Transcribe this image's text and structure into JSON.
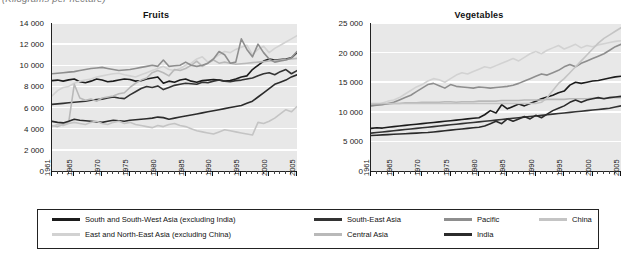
{
  "caption": "(Kilograms per hectare)",
  "legend": {
    "items": [
      {
        "label": "South and South-West Asia (excluding India)",
        "color": "#1c1c1c",
        "weight": "thick",
        "col": 0,
        "row": 0
      },
      {
        "label": "East and North-East Asia (excluding China)",
        "color": "#d2d2d2",
        "weight": "thin",
        "col": 0,
        "row": 1
      },
      {
        "label": "South-East Asia",
        "color": "#333333",
        "weight": "thick",
        "col": 1,
        "row": 0
      },
      {
        "label": "Central Asia",
        "color": "#b9b9b9",
        "weight": "thin",
        "col": 1,
        "row": 1
      },
      {
        "label": "Pacific",
        "color": "#8e8e8e",
        "weight": "thick",
        "col": 2,
        "row": 0
      },
      {
        "label": "India",
        "color": "#2b2b2b",
        "weight": "thick",
        "col": 2,
        "row": 1
      },
      {
        "label": "China",
        "color": "#c4c4c4",
        "weight": "thin",
        "col": 3,
        "row": 0
      }
    ]
  },
  "chart_data": [
    {
      "type": "line",
      "title": "Fruits",
      "xlabel": "",
      "ylabel": "",
      "unit": "Kilograms per hectare",
      "grid": true,
      "legend_position": "bottom",
      "xlim": [
        1961,
        2005
      ],
      "ylim": [
        0,
        14000
      ],
      "yticks": [
        0,
        2000,
        4000,
        6000,
        8000,
        10000,
        12000,
        14000
      ],
      "ytick_labels": [
        "0",
        "2 000",
        "4 000",
        "6 000",
        "8 000",
        "10 000",
        "12 000",
        "14 000"
      ],
      "xticks": [
        1961,
        1965,
        1970,
        1975,
        1980,
        1985,
        1990,
        1995,
        2000,
        2005
      ],
      "xtick_labels": [
        "1961",
        "1965",
        "1970",
        "1975",
        "1980",
        "1985",
        "1990",
        "1995",
        "2000",
        "2005"
      ],
      "x": [
        1961,
        1962,
        1963,
        1964,
        1965,
        1966,
        1967,
        1968,
        1969,
        1970,
        1971,
        1972,
        1973,
        1974,
        1975,
        1976,
        1977,
        1978,
        1979,
        1980,
        1981,
        1982,
        1983,
        1984,
        1985,
        1986,
        1987,
        1988,
        1989,
        1990,
        1991,
        1992,
        1993,
        1994,
        1995,
        1996,
        1997,
        1998,
        1999,
        2000,
        2001,
        2002,
        2003,
        2004,
        2005
      ],
      "series": [
        {
          "name": "South and South-West Asia (excluding India)",
          "color": "#1c1c1c",
          "values": [
            8550,
            8600,
            8500,
            8620,
            8700,
            8450,
            8350,
            8500,
            8700,
            8600,
            8450,
            8500,
            8600,
            8700,
            8650,
            8500,
            8550,
            8700,
            8800,
            8900,
            8300,
            8500,
            8400,
            8600,
            8700,
            8500,
            8400,
            8550,
            8600,
            8650,
            8600,
            8500,
            8550,
            8700,
            8900,
            9000,
            9600,
            10000,
            10400,
            10600,
            10500,
            10550,
            10600,
            10700,
            11200
          ]
        },
        {
          "name": "East and North-East Asia (excluding China)",
          "color": "#d2d2d2",
          "values": [
            7100,
            7600,
            7900,
            8000,
            8300,
            8500,
            8600,
            8700,
            8900,
            9000,
            9100,
            9200,
            9250,
            9100,
            9000,
            8900,
            9100,
            9300,
            9500,
            9700,
            9900,
            9600,
            9500,
            9700,
            10000,
            10200,
            10600,
            10800,
            10300,
            10600,
            11000,
            11300,
            11200,
            11500,
            11700,
            11900,
            11000,
            11500,
            11800,
            11200,
            11600,
            11900,
            12200,
            12500,
            12800
          ]
        },
        {
          "name": "South-East Asia",
          "color": "#333333",
          "values": [
            6300,
            6350,
            6400,
            6450,
            6500,
            6550,
            6600,
            6700,
            6750,
            6800,
            6900,
            7000,
            6900,
            6850,
            7200,
            7500,
            7800,
            8000,
            7900,
            8050,
            7700,
            7900,
            8100,
            8200,
            8300,
            8250,
            8200,
            8400,
            8350,
            8500,
            8600,
            8500,
            8450,
            8550,
            8600,
            8700,
            8800,
            9000,
            9200,
            9300,
            9100,
            9400,
            9600,
            9200,
            9500
          ]
        },
        {
          "name": "Central Asia",
          "color": "#b9b9b9",
          "values": [
            4300,
            4200,
            4400,
            4600,
            8200,
            6900,
            6700,
            6800,
            6600,
            6900,
            7000,
            7100,
            7300,
            7400,
            7900,
            8300,
            8600,
            8800,
            9300,
            9500,
            9300,
            9000,
            9600,
            9500,
            9700,
            10000,
            10400,
            9900,
            10200,
            10500,
            10200,
            10300,
            10200,
            10100,
            10150,
            10200,
            10250,
            10300,
            10350,
            10400,
            10450,
            10500,
            10550,
            10600,
            10650
          ]
        },
        {
          "name": "Pacific",
          "color": "#8e8e8e",
          "values": [
            9200,
            9250,
            9300,
            9350,
            9400,
            9500,
            9600,
            9700,
            9750,
            9800,
            9700,
            9600,
            9500,
            9550,
            9600,
            9700,
            9800,
            9900,
            10000,
            9900,
            10500,
            9900,
            9950,
            10000,
            10300,
            10000,
            9900,
            10000,
            10200,
            10600,
            11300,
            11000,
            10200,
            10300,
            12500,
            11500,
            10800,
            12000,
            11200,
            10600,
            10300,
            10400,
            10500,
            10700,
            11300
          ]
        },
        {
          "name": "India",
          "color": "#2b2b2b",
          "values": [
            4700,
            4600,
            4550,
            4700,
            4900,
            4800,
            4750,
            4700,
            4650,
            4600,
            4700,
            4800,
            4750,
            4700,
            4800,
            4850,
            4900,
            4950,
            5000,
            5100,
            5050,
            4900,
            5000,
            5100,
            5200,
            5300,
            5400,
            5500,
            5600,
            5700,
            5800,
            5900,
            6000,
            6100,
            6200,
            6400,
            6600,
            7000,
            7400,
            7800,
            8200,
            8400,
            8600,
            8900,
            9100
          ]
        },
        {
          "name": "China",
          "color": "#c4c4c4",
          "values": [
            4200,
            4400,
            4300,
            4500,
            4600,
            4500,
            4400,
            4600,
            4700,
            4500,
            4400,
            4600,
            4700,
            4500,
            4600,
            4400,
            4300,
            4200,
            4100,
            4300,
            4200,
            4400,
            4500,
            4300,
            4200,
            4000,
            3800,
            3700,
            3600,
            3500,
            3700,
            3900,
            3800,
            3700,
            3600,
            3500,
            3400,
            4600,
            4500,
            4700,
            5000,
            5400,
            5800,
            5600,
            6100
          ]
        }
      ]
    },
    {
      "type": "line",
      "title": "Vegetables",
      "xlabel": "",
      "ylabel": "",
      "unit": "Kilograms per hectare",
      "grid": true,
      "legend_position": "bottom",
      "xlim": [
        1961,
        2005
      ],
      "ylim": [
        0,
        25000
      ],
      "yticks": [
        0,
        5000,
        10000,
        15000,
        20000,
        25000
      ],
      "ytick_labels": [
        "0",
        "5 000",
        "10 000",
        "15 000",
        "20 000",
        "25 000"
      ],
      "xticks": [
        1961,
        1965,
        1970,
        1975,
        1980,
        1985,
        1990,
        1995,
        2000,
        2005
      ],
      "xtick_labels": [
        "1961",
        "1965",
        "1970",
        "1975",
        "1980",
        "1985",
        "1990",
        "1995",
        "2000",
        "2005"
      ],
      "x": [
        1961,
        1962,
        1963,
        1964,
        1965,
        1966,
        1967,
        1968,
        1969,
        1970,
        1971,
        1972,
        1973,
        1974,
        1975,
        1976,
        1977,
        1978,
        1979,
        1980,
        1981,
        1982,
        1983,
        1984,
        1985,
        1986,
        1987,
        1988,
        1989,
        1990,
        1991,
        1992,
        1993,
        1994,
        1995,
        1996,
        1997,
        1998,
        1999,
        2000,
        2001,
        2002,
        2003,
        2004,
        2005
      ],
      "series": [
        {
          "name": "South and South-West Asia (excluding India)",
          "color": "#1c1c1c",
          "values": [
            7200,
            7300,
            7250,
            7400,
            7500,
            7600,
            7700,
            7800,
            7900,
            8000,
            8100,
            8200,
            8300,
            8400,
            8500,
            8600,
            8700,
            8800,
            8900,
            9000,
            9500,
            10200,
            9800,
            11200,
            10500,
            10900,
            11300,
            11000,
            11400,
            11800,
            12200,
            12500,
            12800,
            13200,
            13500,
            14500,
            15000,
            14800,
            15000,
            15200,
            15300,
            15500,
            15700,
            15900,
            16000
          ]
        },
        {
          "name": "East and North-East Asia (excluding China)",
          "color": "#d2d2d2",
          "values": [
            11000,
            11200,
            11500,
            11800,
            12000,
            12400,
            13000,
            13600,
            14200,
            14600,
            15200,
            15600,
            15400,
            15000,
            15600,
            16200,
            16600,
            16400,
            16800,
            17200,
            17600,
            17400,
            17800,
            18200,
            18600,
            19000,
            18600,
            19200,
            19800,
            20200,
            19800,
            20400,
            20800,
            21200,
            20600,
            21000,
            21400,
            20800,
            21200,
            21000,
            21300,
            21500,
            21700,
            21900,
            22000
          ]
        },
        {
          "name": "South-East Asia",
          "color": "#333333",
          "values": [
            6400,
            6500,
            6600,
            6700,
            6800,
            6900,
            7000,
            7100,
            7200,
            7300,
            7400,
            7500,
            7600,
            7700,
            7800,
            7900,
            8000,
            8100,
            8200,
            8300,
            8400,
            8500,
            8600,
            8700,
            8800,
            8900,
            9000,
            9100,
            9200,
            9300,
            9400,
            9500,
            9600,
            9700,
            9800,
            9900,
            10000,
            10100,
            10200,
            10300,
            10400,
            10500,
            10600,
            10800,
            11000
          ]
        },
        {
          "name": "Central Asia",
          "color": "#b9b9b9",
          "values": [
            11200,
            11200,
            11300,
            11300,
            11400,
            11400,
            11500,
            11500,
            11500,
            11600,
            11600,
            11600,
            11600,
            11700,
            11700,
            11600,
            11700,
            11700,
            11700,
            11800,
            11800,
            11800,
            11800,
            11900,
            11900,
            11900,
            11900,
            12000,
            12000,
            12000,
            12000,
            12100,
            12100,
            12100,
            12100,
            12200,
            12200,
            12200,
            12200,
            12300,
            12300,
            12300,
            12400,
            12400,
            12400
          ]
        },
        {
          "name": "Pacific",
          "color": "#8e8e8e",
          "values": [
            11000,
            11100,
            11200,
            11400,
            11600,
            12000,
            12400,
            12800,
            13400,
            14000,
            14600,
            14800,
            14400,
            14000,
            14600,
            14300,
            14200,
            14100,
            14000,
            14200,
            14100,
            14000,
            14100,
            14200,
            14300,
            14500,
            14800,
            15200,
            15600,
            16000,
            16400,
            16200,
            16600,
            17000,
            17600,
            18000,
            17600,
            18200,
            18600,
            19000,
            19400,
            19800,
            20400,
            21000,
            21400
          ]
        },
        {
          "name": "India",
          "color": "#2b2b2b",
          "values": [
            6000,
            6050,
            6100,
            6150,
            6200,
            6250,
            6300,
            6350,
            6400,
            6450,
            6500,
            6600,
            6700,
            6800,
            6900,
            7000,
            7100,
            7200,
            7300,
            7400,
            7600,
            8000,
            8400,
            8000,
            8800,
            8400,
            8800,
            9200,
            8800,
            9400,
            9000,
            9600,
            10200,
            10600,
            11000,
            11600,
            12000,
            11600,
            12000,
            12200,
            12400,
            12200,
            12400,
            12500,
            12600
          ]
        },
        {
          "name": "China",
          "color": "#c4c4c4",
          "values": [
            11400,
            11400,
            11400,
            11400,
            11400,
            11400,
            11400,
            11400,
            11400,
            11400,
            11400,
            11400,
            11400,
            11400,
            11400,
            11400,
            11400,
            11400,
            11400,
            11400,
            11400,
            11400,
            11400,
            11400,
            11400,
            11400,
            11400,
            11400,
            11400,
            11400,
            11600,
            12400,
            13600,
            14800,
            15600,
            16600,
            17600,
            18600,
            19600,
            20600,
            21600,
            22400,
            23000,
            23600,
            24200
          ]
        }
      ]
    }
  ]
}
